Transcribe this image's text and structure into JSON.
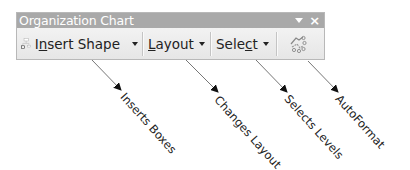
{
  "window": {
    "title": "Organization Chart",
    "controls": {
      "dropdown_icon": "toolbar-options-icon",
      "close_label": "×"
    }
  },
  "toolbar": {
    "buttons": [
      {
        "id": "insert-shape",
        "icon": "org-chart-icon",
        "label_pre": "I",
        "label_ul": "n",
        "label_post": "sert Shape",
        "has_caret": true
      },
      {
        "id": "layout",
        "label_pre": "",
        "label_ul": "L",
        "label_post": "ayout",
        "has_caret": true
      },
      {
        "id": "select",
        "label_pre": "Sele",
        "label_ul": "c",
        "label_post": "t",
        "has_caret": true
      },
      {
        "id": "autoformat",
        "icon": "autoformat-icon",
        "has_caret": false
      }
    ]
  },
  "annotations": [
    {
      "text": "Inserts Boxes",
      "target": "insert-shape"
    },
    {
      "text": "Changes Layout",
      "target": "layout"
    },
    {
      "text": "Selects Levels",
      "target": "select"
    },
    {
      "text": "AutoFormat",
      "target": "autoformat"
    }
  ],
  "colors": {
    "titlebar_bg": "#a9a9a9",
    "toolbar_bg": "#ececec",
    "text": "#222222",
    "title_text": "#ffffff"
  }
}
